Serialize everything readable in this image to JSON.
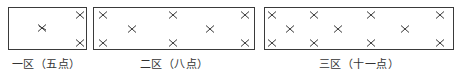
{
  "diagram": {
    "title": "",
    "marker_symbol": "×",
    "line_color": "#3a3a3a",
    "zones": [
      {
        "label": "一区（五点）",
        "box": {
          "x": 8,
          "y": 7,
          "w": 79,
          "h": 43
        },
        "label_x": 46,
        "points": [
          [
            42,
            28,
            true
          ],
          [
            80,
            15,
            false
          ],
          [
            80,
            43,
            false
          ]
        ]
      },
      {
        "label": "二区（八点）",
        "box": {
          "x": 93,
          "y": 7,
          "w": 162,
          "h": 43
        },
        "label_x": 174,
        "points": [
          [
            103,
            15,
            false
          ],
          [
            173,
            15,
            false
          ],
          [
            132,
            29,
            false
          ],
          [
            210,
            29,
            false
          ],
          [
            103,
            43,
            false
          ],
          [
            173,
            43,
            false
          ],
          [
            245,
            15,
            false
          ],
          [
            245,
            43,
            false
          ]
        ]
      },
      {
        "label": "三区（十一点）",
        "box": {
          "x": 264,
          "y": 7,
          "w": 190,
          "h": 43
        },
        "label_x": 359,
        "points": [
          [
            272,
            15,
            false
          ],
          [
            314,
            15,
            false
          ],
          [
            371,
            15,
            false
          ],
          [
            440,
            15,
            false
          ],
          [
            290,
            29,
            false
          ],
          [
            338,
            29,
            false
          ],
          [
            405,
            29,
            false
          ],
          [
            272,
            43,
            false
          ],
          [
            314,
            43,
            false
          ],
          [
            371,
            43,
            false
          ],
          [
            440,
            43,
            false
          ]
        ]
      }
    ]
  }
}
